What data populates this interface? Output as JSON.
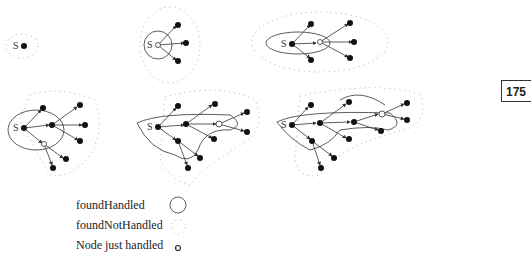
{
  "page_number": "175",
  "legend": {
    "items": [
      {
        "label": "foundHandled",
        "symbol": "solid-circle"
      },
      {
        "label": "foundNotHandled",
        "symbol": "dotted-circle"
      },
      {
        "label": "Node just handled",
        "symbol": "small-open-circle"
      }
    ]
  },
  "diagram": {
    "source_label": "S",
    "panels": 6
  },
  "colors": {
    "stroke": "#333333",
    "node": "#111111",
    "dots": "#888888"
  }
}
